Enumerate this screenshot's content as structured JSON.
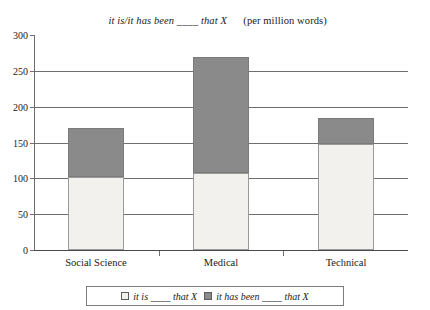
{
  "chart_data": {
    "type": "bar",
    "title_main": "it is/it has been ____ that X",
    "title_note": "(per million words)",
    "stacked": true,
    "categories": [
      "Social Science",
      "Medical",
      "Technical"
    ],
    "series": [
      {
        "name": "it is ____ that X",
        "values": [
          102,
          108,
          148
        ],
        "color": "#f2f1ee"
      },
      {
        "name": "it has been ____ that X",
        "values": [
          68,
          162,
          36
        ],
        "color": "#8a8a8a"
      }
    ],
    "totals": [
      170,
      270,
      184
    ],
    "xlabel": "",
    "ylabel": "",
    "ylim": [
      0,
      300
    ],
    "yticks": [
      0,
      50,
      100,
      150,
      200,
      250,
      300
    ],
    "ytick_labels": [
      "0",
      "50",
      "100",
      "150",
      "200",
      "250",
      "300"
    ],
    "grid": true,
    "legend_position": "bottom"
  },
  "legend": {
    "entries": [
      {
        "label": "it is ____ that X",
        "swatch": "light"
      },
      {
        "label": "it has been ____ that X",
        "swatch": "dark"
      }
    ]
  },
  "colors": {
    "light_segment": "#f2f1ee",
    "dark_segment": "#8a8a8a",
    "axis": "#6e6e6e",
    "text": "#1a1a1a"
  }
}
